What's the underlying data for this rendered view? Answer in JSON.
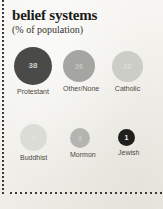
{
  "header": {
    "title": "belief systems",
    "subtitle": "(% of population)"
  },
  "chart_data": {
    "type": "bubble",
    "title": "belief systems",
    "subtitle": "(% of population)",
    "unit": "percent of population",
    "xlabel": "",
    "ylabel": "",
    "grid": false,
    "legend": "none",
    "categories": [
      "Protestant",
      "Other/None",
      "Catholic",
      "Buddhist",
      "Mormon",
      "Jewish"
    ],
    "values": [
      38,
      26,
      22,
      1,
      3,
      1
    ],
    "series": [
      {
        "name": "% of population",
        "values": [
          38,
          26,
          22,
          1,
          3,
          1
        ]
      }
    ],
    "points": [
      {
        "label": "Protestant",
        "value": 38,
        "value_text": "38",
        "row": 1,
        "diameter": 38,
        "fill": "#4a4a48",
        "text_color": "#cfcfcb",
        "value_font_size": 8,
        "left": 14,
        "top": 47
      },
      {
        "label": "Other/None",
        "value": 26,
        "value_text": "26",
        "row": 1,
        "diameter": 32,
        "fill": "#a5a5a1",
        "text_color": "#c8c8c4",
        "value_font_size": 7,
        "left": 63,
        "top": 50
      },
      {
        "label": "Catholic",
        "value": 22,
        "value_text": "22",
        "row": 1,
        "diameter": 31,
        "fill": "#cdcdc8",
        "text_color": "#dededa",
        "value_font_size": 7,
        "left": 112,
        "top": 51
      },
      {
        "label": "Buddhist",
        "value": 1,
        "value_text": "1",
        "row": 2,
        "diameter": 27,
        "fill": "#dcdcd6",
        "text_color": "#e7e7e2",
        "value_font_size": 7,
        "left": 20,
        "top": 124
      },
      {
        "label": "Mormon",
        "value": 3,
        "value_text": "3",
        "row": 2,
        "diameter": 20,
        "fill": "#b4b4b0",
        "text_color": "#cdcdc9",
        "value_font_size": 7,
        "left": 70,
        "top": 128
      },
      {
        "label": "Jewish",
        "value": 1,
        "value_text": "1",
        "row": 2,
        "diameter": 17,
        "fill": "#1f1f1d",
        "text_color": "#f0f0ec",
        "value_font_size": 7,
        "left": 118,
        "top": 129
      }
    ]
  }
}
